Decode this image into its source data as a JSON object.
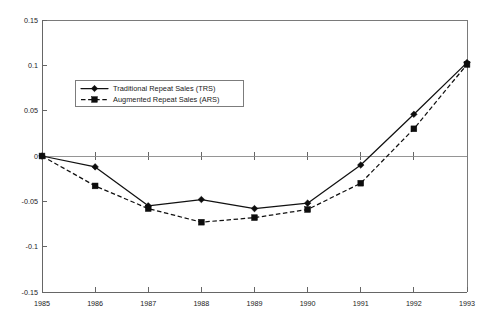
{
  "chart_data": {
    "type": "line",
    "title": "",
    "subtitle": "",
    "xlabel": "",
    "ylabel": "",
    "categories": [
      "1985",
      "1986",
      "1987",
      "1988",
      "1989",
      "1990",
      "1991",
      "1992",
      "1993"
    ],
    "x": [
      1985,
      1986,
      1987,
      1988,
      1989,
      1990,
      1991,
      1992,
      1993
    ],
    "xlim": [
      1985,
      1993
    ],
    "ylim": [
      -0.15,
      0.15
    ],
    "ytick_labels": [
      "0.15",
      "0.1",
      "0.05",
      "0",
      "-0.05",
      "-0.1",
      "-0.15"
    ],
    "ytick_values": [
      0.15,
      0.1,
      0.05,
      0,
      -0.05,
      -0.1,
      -0.15
    ],
    "xtick_labels": [
      "1985",
      "1986",
      "1987",
      "1988",
      "1989",
      "1990",
      "1991",
      "1992",
      "1993"
    ],
    "grid": false,
    "legend_position": "upper-left-inside",
    "series": [
      {
        "name": "Traditional Repeat Sales (TRS)",
        "abbr": "TRS",
        "line_style": "solid",
        "marker": "diamond",
        "color": "#111111",
        "values": [
          0,
          -0.012,
          -0.055,
          -0.048,
          -0.058,
          -0.052,
          -0.01,
          0.046,
          0.103
        ]
      },
      {
        "name": "Augmented Repeat Sales (ARS)",
        "abbr": "ARS",
        "line_style": "dashed",
        "marker": "square",
        "color": "#111111",
        "values": [
          0,
          -0.033,
          -0.058,
          -0.073,
          -0.068,
          -0.059,
          -0.03,
          0.03,
          0.101
        ]
      }
    ]
  },
  "legend": {
    "entries": [
      {
        "label": "Traditional Repeat Sales (TRS)"
      },
      {
        "label": "Augmented Repeat Sales (ARS)"
      }
    ]
  },
  "colors": {
    "series": "#111111",
    "axis": "#666666",
    "frame": "#7a7a7a",
    "background": "#ffffff"
  }
}
